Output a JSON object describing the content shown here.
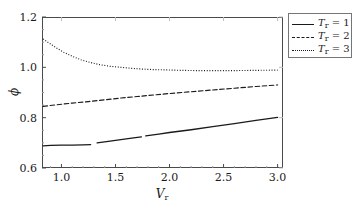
{
  "chart_data": {
    "type": "line",
    "title": "",
    "xlabel": "V_r",
    "ylabel": "phi",
    "xlim": [
      0.82,
      3.05
    ],
    "ylim": [
      0.6,
      1.2
    ],
    "grid": false,
    "legend_position": "top-right",
    "xticks": [
      "1.0",
      "1.5",
      "2.0",
      "2.5",
      "3.0"
    ],
    "xtick_values": [
      1.0,
      1.5,
      2.0,
      2.5,
      3.0
    ],
    "yticks": [
      "0.6",
      "0.8",
      "1.0",
      "1.2"
    ],
    "ytick_values": [
      0.6,
      0.8,
      1.0,
      1.2
    ],
    "series": [
      {
        "name": "T_r = 1",
        "style": "solid",
        "color": "#1a1a1a",
        "segments": [
          [
            [
              0.83,
              0.688
            ],
            [
              0.9,
              0.69
            ],
            [
              1.0,
              0.691
            ],
            [
              1.1,
              0.691
            ],
            [
              1.2,
              0.692
            ],
            [
              1.27,
              0.693
            ]
          ],
          [
            [
              1.33,
              0.7
            ],
            [
              1.45,
              0.707
            ],
            [
              1.55,
              0.713
            ],
            [
              1.65,
              0.719
            ],
            [
              1.74,
              0.724
            ]
          ],
          [
            [
              1.78,
              0.728
            ],
            [
              1.9,
              0.735
            ],
            [
              2.0,
              0.741
            ],
            [
              2.2,
              0.752
            ],
            [
              2.4,
              0.764
            ],
            [
              2.6,
              0.776
            ],
            [
              2.8,
              0.789
            ],
            [
              3.0,
              0.801
            ]
          ]
        ]
      },
      {
        "name": "T_r = 2",
        "style": "dashed",
        "color": "#1a1a1a",
        "segments": [
          [
            [
              0.83,
              0.845
            ],
            [
              0.95,
              0.851
            ],
            [
              1.1,
              0.858
            ],
            [
              1.25,
              0.864
            ],
            [
              1.4,
              0.871
            ],
            [
              1.55,
              0.878
            ],
            [
              1.7,
              0.884
            ],
            [
              1.85,
              0.89
            ],
            [
              2.0,
              0.896
            ],
            [
              2.2,
              0.903
            ],
            [
              2.4,
              0.91
            ],
            [
              2.6,
              0.917
            ],
            [
              2.8,
              0.924
            ],
            [
              3.0,
              0.93
            ]
          ]
        ]
      },
      {
        "name": "T_r = 3",
        "style": "dotted",
        "color": "#1a1a1a",
        "segments": [
          [
            [
              0.83,
              1.113
            ],
            [
              0.88,
              1.098
            ],
            [
              0.95,
              1.078
            ],
            [
              1.02,
              1.06
            ],
            [
              1.1,
              1.044
            ],
            [
              1.18,
              1.03
            ],
            [
              1.26,
              1.02
            ],
            [
              1.35,
              1.011
            ],
            [
              1.45,
              1.004
            ],
            [
              1.55,
              1.0
            ],
            [
              1.65,
              0.996
            ],
            [
              1.75,
              0.993
            ],
            [
              1.85,
              0.991
            ],
            [
              1.95,
              0.99
            ],
            [
              2.1,
              0.988
            ],
            [
              2.25,
              0.987
            ],
            [
              2.4,
              0.987
            ],
            [
              2.6,
              0.987
            ],
            [
              2.8,
              0.988
            ],
            [
              3.0,
              0.989
            ]
          ]
        ]
      }
    ]
  },
  "axes": {
    "x_title_main": "V",
    "x_title_sub": "r",
    "y_title": "ϕ"
  },
  "legend": {
    "entries": [
      {
        "prefix": "T",
        "sub": "r",
        "eq": " = 1",
        "style": "solid"
      },
      {
        "prefix": "T",
        "sub": "r",
        "eq": " = 2",
        "style": "dashed"
      },
      {
        "prefix": "T",
        "sub": "r",
        "eq": " = 3",
        "style": "dotted"
      }
    ]
  }
}
